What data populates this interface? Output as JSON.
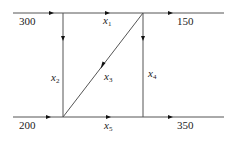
{
  "diagram": {
    "type": "traffic-flow-network",
    "inflows": [
      {
        "id": "top-left",
        "value": "300"
      },
      {
        "id": "bottom-left",
        "value": "200"
      }
    ],
    "outflows": [
      {
        "id": "top-right",
        "value": "150"
      },
      {
        "id": "bottom-right",
        "value": "350"
      }
    ],
    "edges": [
      {
        "var": "x",
        "sub": "1",
        "from": "top-left-node",
        "to": "top-right-node"
      },
      {
        "var": "x",
        "sub": "2",
        "from": "top-left-node",
        "to": "bottom-left-node"
      },
      {
        "var": "x",
        "sub": "3",
        "from": "top-right-node",
        "to": "bottom-left-node"
      },
      {
        "var": "x",
        "sub": "4",
        "from": "top-right-node",
        "to": "bottom-right-node"
      },
      {
        "var": "x",
        "sub": "5",
        "from": "bottom-left-node",
        "to": "bottom-right-node"
      }
    ],
    "line_color": "#555555",
    "arrow_color": "#111111"
  }
}
